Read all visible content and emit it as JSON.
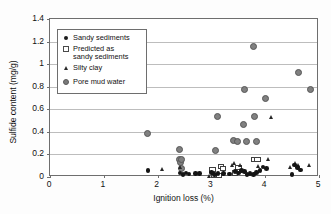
{
  "chart_data": {
    "type": "scatter",
    "title": "",
    "xlabel": "Ignition loss (%)",
    "ylabel": "Sulfide content (mg/g)",
    "xlim": [
      0,
      5
    ],
    "ylim": [
      0,
      1.4
    ],
    "xticks": [
      "0",
      "1",
      "2",
      "3",
      "4",
      "5"
    ],
    "yticks": [
      "0",
      "0.2",
      "0.4",
      "0.6",
      "0.8",
      "1",
      "1.2",
      "1.4"
    ],
    "grid": "horizontal",
    "legend_position": "top-left-inside",
    "series": [
      {
        "name": "Sandy sediments",
        "marker": "filled-circle-small",
        "color": "#141414",
        "points": [
          [
            1.82,
            0.055
          ],
          [
            2.42,
            0.035
          ],
          [
            2.47,
            0.022
          ],
          [
            2.53,
            0.035
          ],
          [
            2.58,
            0.028
          ],
          [
            2.7,
            0.03
          ],
          [
            2.78,
            0.032
          ],
          [
            3.0,
            0.04
          ],
          [
            3.06,
            0.022
          ],
          [
            3.12,
            0.03
          ],
          [
            3.22,
            0.03
          ],
          [
            3.34,
            0.028
          ],
          [
            3.44,
            0.05
          ],
          [
            3.5,
            0.035
          ],
          [
            3.56,
            0.06
          ],
          [
            3.62,
            0.048
          ],
          [
            3.66,
            0.02
          ],
          [
            3.72,
            0.03
          ],
          [
            3.78,
            0.02
          ],
          [
            3.84,
            0.042
          ],
          [
            3.9,
            0.06
          ],
          [
            3.96,
            0.088
          ],
          [
            4.02,
            0.075
          ],
          [
            4.5,
            0.022
          ],
          [
            4.54,
            0.105
          ],
          [
            4.6,
            0.085
          ],
          [
            4.66,
            0.062
          ]
        ]
      },
      {
        "name": "Predicted as sandy sediments",
        "marker": "open-square",
        "color": "#3f3f3f",
        "points": [
          [
            3.02,
            0.07
          ],
          [
            3.06,
            0.012
          ],
          [
            3.14,
            0.012
          ],
          [
            3.18,
            0.09
          ],
          [
            3.22,
            0.072
          ],
          [
            3.44,
            0.035
          ],
          [
            3.5,
            0.085
          ],
          [
            3.8,
            0.155
          ],
          [
            3.86,
            0.152
          ]
        ]
      },
      {
        "name": "Silty clay",
        "marker": "filled-triangle",
        "color": "#262626",
        "points": [
          [
            2.1,
            0.07
          ],
          [
            2.42,
            0.082
          ],
          [
            2.96,
            0.008
          ],
          [
            3.4,
            0.1
          ],
          [
            3.44,
            0.118
          ],
          [
            3.54,
            0.1
          ],
          [
            3.88,
            0.095
          ],
          [
            4.06,
            0.15
          ],
          [
            4.12,
            0.53
          ],
          [
            4.48,
            0.082
          ],
          [
            4.56,
            0.12
          ],
          [
            4.62,
            0.1
          ],
          [
            4.82,
            0.098
          ]
        ]
      },
      {
        "name": "Pore mud water",
        "marker": "filled-circle-large",
        "color": "#808080",
        "points": [
          [
            1.82,
            0.388
          ],
          [
            2.4,
            0.24
          ],
          [
            2.4,
            0.155
          ],
          [
            2.42,
            0.128
          ],
          [
            2.44,
            0.155
          ],
          [
            2.44,
            0.078
          ],
          [
            3.08,
            0.238
          ],
          [
            3.12,
            0.538
          ],
          [
            3.42,
            0.32
          ],
          [
            3.48,
            0.318
          ],
          [
            3.6,
            0.462
          ],
          [
            3.62,
            0.778
          ],
          [
            3.66,
            0.315
          ],
          [
            3.78,
            1.16
          ],
          [
            3.8,
            0.538
          ],
          [
            3.84,
            0.315
          ],
          [
            4.0,
            0.7
          ],
          [
            4.62,
            0.93
          ],
          [
            4.84,
            0.778
          ]
        ]
      }
    ]
  },
  "legend": {
    "items": [
      {
        "label": "Sandy sediments",
        "symbol": "filled-circle-small-icon"
      },
      {
        "label": "Predicted as",
        "label2": "sandy sediments",
        "symbol": "open-square-icon"
      },
      {
        "label": "Silty clay",
        "symbol": "filled-triangle-icon"
      },
      {
        "label": "Pore mud water",
        "symbol": "filled-circle-large-icon"
      }
    ]
  }
}
